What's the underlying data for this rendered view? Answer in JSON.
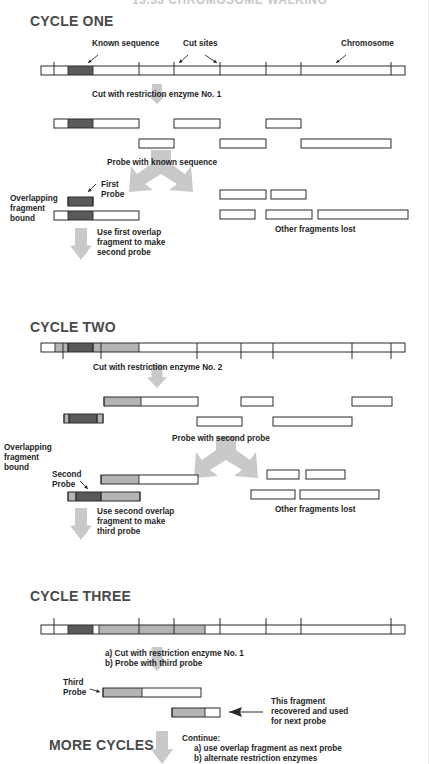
{
  "title": "13.33 CHROMOSOME WALKING",
  "colors": {
    "dark": "#5a5a5a",
    "light": "#b4b4b4",
    "arrow": "#c9c9c9",
    "line": "#2a2a2a",
    "white": "#ffffff"
  },
  "cycle_one": {
    "heading": "CYCLE ONE",
    "labels": {
      "known_sequence": "Known sequence",
      "cut_sites": "Cut sites",
      "chromosome": "Chromosome",
      "cut_step": "Cut with restriction enzyme No. 1",
      "probe_step": "Probe with known sequence",
      "first_probe_1": "First",
      "first_probe_2": "Probe",
      "overlap_1": "Overlapping",
      "overlap_2": "fragment",
      "overlap_3": "bound",
      "use_1": "Use first overlap",
      "use_2": "fragment to make",
      "use_3": "second probe",
      "lost": "Other fragments lost"
    }
  },
  "cycle_two": {
    "heading": "CYCLE TWO",
    "labels": {
      "cut_step": "Cut with restriction enzyme No. 2",
      "probe_step": "Probe with second probe",
      "overlap_1": "Overlapping",
      "overlap_2": "fragment",
      "overlap_3": "bound",
      "second_probe_1": "Second",
      "second_probe_2": "Probe",
      "use_1": "Use second overlap",
      "use_2": "fragment to make",
      "use_3": "third probe",
      "lost": "Other fragments lost"
    }
  },
  "cycle_three": {
    "heading": "CYCLE THREE",
    "labels": {
      "step_a": "a) Cut with restriction enzyme No. 1",
      "step_b": "b)  Probe with third probe",
      "third_probe_1": "Third",
      "third_probe_2": "Probe",
      "recovered_1": "This fragment",
      "recovered_2": "recovered and used",
      "recovered_3": "for next probe"
    }
  },
  "more_cycles": {
    "heading": "MORE CYCLES",
    "continue": "Continue:",
    "item_a": "a)  use overlap fragment as next probe",
    "item_b": "b)  alternate restriction enzymes"
  },
  "diagram": {
    "chromosome_span": [
      41,
      405
    ],
    "enzyme1_cut_sites": [
      54,
      139,
      174,
      220,
      266,
      301,
      391
    ],
    "enzyme2_cut_sites": [
      63,
      101,
      197,
      241,
      273,
      352,
      391
    ],
    "known_sequence_span": [
      68,
      93
    ]
  }
}
